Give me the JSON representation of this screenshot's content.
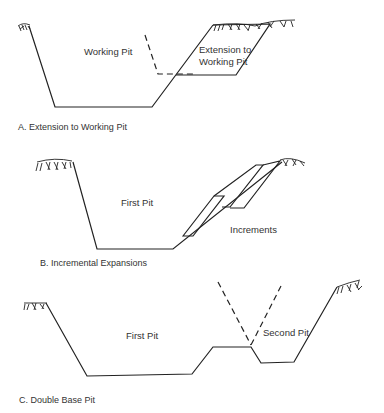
{
  "figure": {
    "panels": [
      {
        "id": "A",
        "caption": "A. Extension to Working Pit",
        "labels": {
          "main": "Working Pit",
          "extension_line1": "Extension to",
          "extension_line2": "Working Pit"
        }
      },
      {
        "id": "B",
        "caption": "B. Incremental Expansions",
        "labels": {
          "main": "First Pit",
          "increments": "Increments"
        }
      },
      {
        "id": "C",
        "caption": "C. Double Base Pit",
        "labels": {
          "first": "First Pit",
          "second": "Second Pit"
        }
      }
    ]
  },
  "colors": {
    "line": "#222222",
    "text": "#333333",
    "background": "#ffffff"
  }
}
